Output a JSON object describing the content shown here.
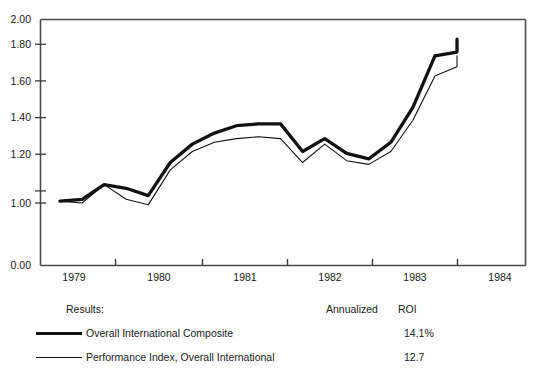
{
  "chart_data": {
    "type": "line",
    "title": "",
    "xlabel": "",
    "ylabel": "",
    "grid": false,
    "legend_position": "below",
    "ylim": [
      0.0,
      2.0
    ],
    "y_axis_broken": true,
    "y_ticks": [
      "2.00",
      "1.80",
      "1.60",
      "1.40",
      "1.20",
      "1.00",
      "0.00"
    ],
    "y_tick_values": [
      2.0,
      1.8,
      1.6,
      1.4,
      1.2,
      1.0,
      0.0
    ],
    "x_tick_labels": [
      "1979",
      "1980",
      "1981",
      "1982",
      "1983",
      "1984"
    ],
    "x_range": [
      "1978.75",
      "1984.5"
    ],
    "x": [
      1978.88,
      1979.13,
      1979.38,
      1979.63,
      1979.88,
      1980.13,
      1980.38,
      1980.63,
      1980.88,
      1981.13,
      1981.38,
      1981.63,
      1981.88,
      1982.13,
      1982.38,
      1982.63,
      1982.88,
      1983.13,
      1983.38
    ],
    "series": [
      {
        "name": "Overall International Composite",
        "style": "bold",
        "color": "#111111",
        "annualized_roi": "14.1%",
        "values": [
          1.01,
          1.02,
          1.1,
          1.08,
          1.04,
          1.22,
          1.32,
          1.38,
          1.42,
          1.43,
          1.43,
          1.28,
          1.35,
          1.27,
          1.24,
          1.33,
          1.52,
          1.8,
          1.82
        ],
        "final_value": 1.89
      },
      {
        "name": "Performance Index, Overall International",
        "style": "thin",
        "color": "#111111",
        "annualized_roi": "12.7",
        "values": [
          1.01,
          1.0,
          1.1,
          1.02,
          0.99,
          1.18,
          1.28,
          1.33,
          1.35,
          1.36,
          1.35,
          1.22,
          1.32,
          1.23,
          1.21,
          1.28,
          1.45,
          1.69,
          1.74
        ],
        "final_value": 1.8
      }
    ]
  },
  "legend": {
    "results_label": "Results:",
    "annualized_header": "Annualized",
    "roi_header": "ROI",
    "rows": [
      {
        "swatch": "bold",
        "name": "Overall International Composite",
        "value": "14.1%"
      },
      {
        "swatch": "thin",
        "name": "Performance Index, Overall International",
        "value": "12.7"
      }
    ]
  },
  "axis": {
    "y_labels": [
      "2.00",
      "1.80",
      "1.60",
      "1.40",
      "1.20",
      "1.00",
      "0.00"
    ],
    "x_labels": [
      "1979",
      "1980",
      "1981",
      "1982",
      "1983",
      "1984"
    ]
  }
}
